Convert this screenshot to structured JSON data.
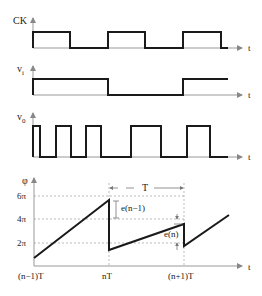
{
  "diagram": {
    "ck": {
      "label": "CK",
      "axis_label": "t"
    },
    "vi": {
      "label": "v",
      "sub": "i",
      "axis_label": "t"
    },
    "vo": {
      "label": "v",
      "sub": "0",
      "axis_label": "t"
    },
    "phi": {
      "label": "φ",
      "axis_label": "t",
      "y_ticks": [
        "6π",
        "4π",
        "2π"
      ],
      "x_ticks": [
        "(n−1)T",
        "nT",
        "(n+1)T"
      ],
      "period_label": "T",
      "error_labels": [
        "e(n−1)",
        "e(n)"
      ]
    }
  }
}
